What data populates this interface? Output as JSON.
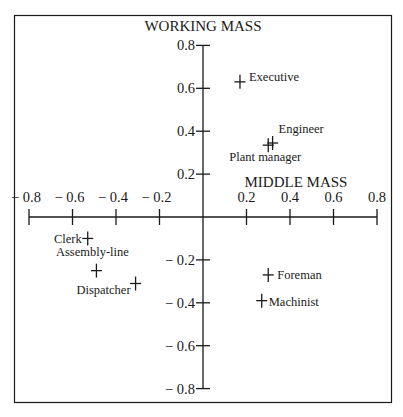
{
  "chart_data": {
    "type": "scatter",
    "title": "",
    "xlabel": "MIDDLE MASS",
    "ylabel": "WORKING MASS",
    "xlim": [
      -0.8,
      0.8
    ],
    "ylim": [
      -0.8,
      0.8
    ],
    "grid": false,
    "legend": null,
    "x_ticks": [
      -0.8,
      -0.6,
      -0.4,
      -0.2,
      0.2,
      0.4,
      0.6,
      0.8
    ],
    "x_tick_labels": [
      "− 0.8",
      "− 0.6",
      "− 0.4",
      "− 0.2",
      "0.2",
      "0.4",
      "0.6",
      "0.8"
    ],
    "y_ticks": [
      0.8,
      0.6,
      0.4,
      0.2,
      -0.2,
      -0.4,
      -0.6,
      -0.8
    ],
    "y_tick_labels": [
      "0.8",
      "0.6",
      "0.4",
      "0.2",
      "− 0.2",
      "− 0.4",
      "− 0.6",
      "− 0.8"
    ],
    "marker": "plus",
    "points": [
      {
        "label": "Executive",
        "x": 0.17,
        "y": 0.63
      },
      {
        "label": "Engineer",
        "x": 0.32,
        "y": 0.345
      },
      {
        "label": "Plant manager",
        "x": 0.3,
        "y": 0.335
      },
      {
        "label": "Clerk",
        "x": -0.53,
        "y": -0.1
      },
      {
        "label": "Assembly-line",
        "x": -0.49,
        "y": -0.25
      },
      {
        "label": "Dispatcher",
        "x": -0.31,
        "y": -0.31
      },
      {
        "label": "Foreman",
        "x": 0.3,
        "y": -0.27
      },
      {
        "label": "Machinist",
        "x": 0.27,
        "y": -0.39
      }
    ]
  },
  "colors": {
    "ink": "#1a1a1a",
    "background": "#ffffff"
  }
}
